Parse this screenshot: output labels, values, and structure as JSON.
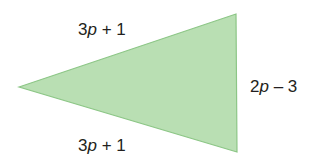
{
  "diagram": {
    "shape": "isosceles-triangle",
    "fill_color": "#b9dfb3",
    "edge_color": "#8cc686",
    "vertices": {
      "left": [
        19,
        87
      ],
      "top_right": [
        236,
        14
      ],
      "bottom_right": [
        237,
        152
      ]
    },
    "sides": {
      "top": {
        "coef": "3",
        "var": "p",
        "rest": " + 1"
      },
      "bottom": {
        "coef": "3",
        "var": "p",
        "rest": " + 1"
      },
      "right": {
        "coef": "2",
        "var": "p",
        "rest": " – 3"
      }
    }
  }
}
